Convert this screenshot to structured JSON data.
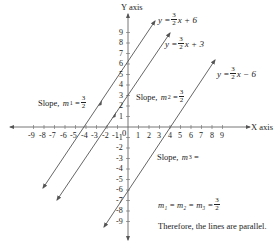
{
  "axes": {
    "x_label": "X axis",
    "y_label": "Y axis",
    "origin_label": "0",
    "x_ticks_negative": [
      "-9",
      "-8",
      "-7",
      "-6",
      "-5",
      "-4",
      "-3",
      "-2",
      "-1"
    ],
    "x_ticks_positive": [
      "1",
      "2",
      "3",
      "4",
      "5",
      "6",
      "7",
      "8",
      "9"
    ],
    "y_ticks_positive": [
      "1",
      "2",
      "3",
      "4",
      "5",
      "6",
      "7",
      "8",
      "9"
    ],
    "y_ticks_negative": [
      "-1",
      "-2",
      "-3",
      "-4",
      "-5",
      "-6",
      "-7",
      "-8",
      "-9"
    ]
  },
  "lines": [
    {
      "equation_prefix": "y =",
      "slope_num": "3",
      "slope_den": "2",
      "equation_suffix": "x + 6",
      "slope_label_prefix": "Slope,",
      "slope_var": "m",
      "slope_sub": "1",
      "slope_label_eq": "=",
      "slope_num_label": "3",
      "slope_den_label": "2"
    },
    {
      "equation_prefix": "y =",
      "slope_num": "3",
      "slope_den": "2",
      "equation_suffix": "x + 3",
      "slope_label_prefix": "Slope,",
      "slope_var": "m",
      "slope_sub": "2",
      "slope_label_eq": "=",
      "slope_num_label": "3",
      "slope_den_label": "2"
    },
    {
      "equation_prefix": "y =",
      "slope_num": "3",
      "slope_den": "2",
      "equation_suffix": "x − 6",
      "slope_label_prefix": "Slope,",
      "slope_var": "m",
      "slope_sub": "3",
      "slope_label_eq": "="
    }
  ],
  "conclusion": {
    "equality": "m₁ = m₂ = m₃ =",
    "value_num": "3",
    "value_den": "2",
    "text": "Therefore, the lines are parallel."
  },
  "colors": {
    "line": "#555555",
    "axis": "#666666",
    "text": "#222222"
  }
}
